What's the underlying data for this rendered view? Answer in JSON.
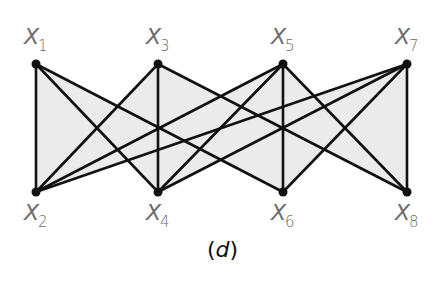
{
  "figure": {
    "caption": "(d)",
    "caption_letter": "d",
    "colors": {
      "edge": "#111111",
      "node": "#111111",
      "fill": "#ebebeb",
      "label": "#6b6b6b"
    },
    "nodes": [
      {
        "id": "X1",
        "base": "X",
        "sub": "1",
        "x": 36,
        "y": 64,
        "row": "top"
      },
      {
        "id": "X3",
        "base": "X",
        "sub": "3",
        "x": 158,
        "y": 64,
        "row": "top"
      },
      {
        "id": "X5",
        "base": "X",
        "sub": "5",
        "x": 283,
        "y": 64,
        "row": "top"
      },
      {
        "id": "X7",
        "base": "X",
        "sub": "7",
        "x": 407,
        "y": 64,
        "row": "top"
      },
      {
        "id": "X2",
        "base": "X",
        "sub": "2",
        "x": 36,
        "y": 192,
        "row": "bottom"
      },
      {
        "id": "X4",
        "base": "X",
        "sub": "4",
        "x": 158,
        "y": 192,
        "row": "bottom"
      },
      {
        "id": "X6",
        "base": "X",
        "sub": "6",
        "x": 283,
        "y": 192,
        "row": "bottom"
      },
      {
        "id": "X8",
        "base": "X",
        "sub": "8",
        "x": 407,
        "y": 192,
        "row": "bottom"
      }
    ],
    "edges": [
      [
        "X1",
        "X2"
      ],
      [
        "X1",
        "X4"
      ],
      [
        "X1",
        "X6"
      ],
      [
        "X3",
        "X2"
      ],
      [
        "X3",
        "X4"
      ],
      [
        "X3",
        "X8"
      ],
      [
        "X5",
        "X2"
      ],
      [
        "X5",
        "X4"
      ],
      [
        "X5",
        "X6"
      ],
      [
        "X5",
        "X8"
      ],
      [
        "X7",
        "X2"
      ],
      [
        "X7",
        "X4"
      ],
      [
        "X7",
        "X6"
      ],
      [
        "X7",
        "X8"
      ]
    ],
    "fill_polygon": [
      [
        36,
        64
      ],
      [
        117.7,
        106.3
      ],
      [
        158,
        64
      ],
      [
        220.7,
        96.2
      ],
      [
        283,
        64
      ],
      [
        314.1,
        96.1
      ],
      [
        407,
        64
      ],
      [
        407,
        192
      ],
      [
        324.4,
        149.3
      ],
      [
        283,
        192
      ],
      [
        220.8,
        159.8
      ],
      [
        158,
        192
      ],
      [
        127.8,
        160.3
      ],
      [
        36,
        192
      ]
    ]
  }
}
